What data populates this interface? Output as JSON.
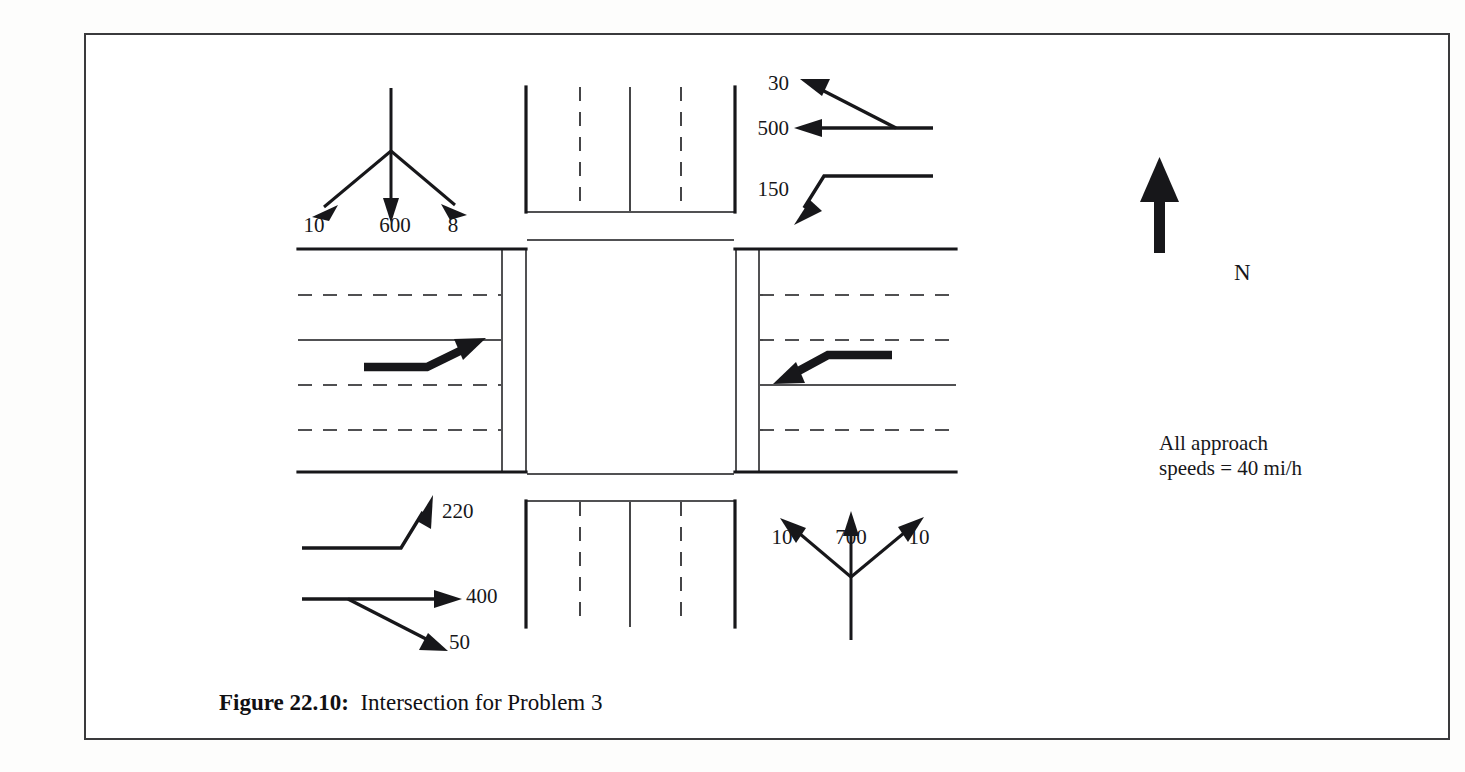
{
  "figure": {
    "caption_label": "Figure 22.10:",
    "caption_text": "Intersection for Problem 3",
    "compass_label": "N",
    "note_line_1": "All approach",
    "note_line_2": "speeds = 40 mi/h",
    "frame_color": "#3a3a3c",
    "ink_color": "#17171a"
  },
  "approaches": {
    "southbound": {
      "name": "north-leg-southbound-approach",
      "corner": "northwest",
      "movements": [
        {
          "label": "10",
          "movement": "right-turn",
          "arrow": "diagonal-down-left"
        },
        {
          "label": "600",
          "movement": "through",
          "arrow": "straight-down"
        },
        {
          "label": "8",
          "movement": "left-turn",
          "arrow": "diagonal-down-right"
        }
      ]
    },
    "westbound": {
      "name": "east-leg-westbound-approach",
      "corner": "northeast",
      "movements": [
        {
          "label": "30",
          "movement": "right-turn",
          "arrow": "diagonal-up-left"
        },
        {
          "label": "500",
          "movement": "through",
          "arrow": "straight-left"
        },
        {
          "label": "150",
          "movement": "left-turn",
          "arrow": "hook-down-left"
        }
      ]
    },
    "eastbound": {
      "name": "west-leg-eastbound-approach",
      "corner": "southwest",
      "movements": [
        {
          "label": "220",
          "movement": "left-turn",
          "arrow": "hook-up-right"
        },
        {
          "label": "400",
          "movement": "through",
          "arrow": "straight-right"
        },
        {
          "label": "50",
          "movement": "right-turn",
          "arrow": "diagonal-down-right"
        }
      ]
    },
    "northbound": {
      "name": "south-leg-northbound-approach",
      "corner": "southeast",
      "movements": [
        {
          "label": "10",
          "movement": "left-turn",
          "arrow": "diagonal-up-left"
        },
        {
          "label": "700",
          "movement": "through",
          "arrow": "straight-up"
        },
        {
          "label": "10",
          "movement": "right-turn",
          "arrow": "diagonal-up-right"
        }
      ]
    }
  },
  "lane_markings": {
    "west_leg_arrow": "bold-lane-change-arrow-up-right",
    "east_leg_arrow": "bold-lane-change-arrow-down-left"
  }
}
